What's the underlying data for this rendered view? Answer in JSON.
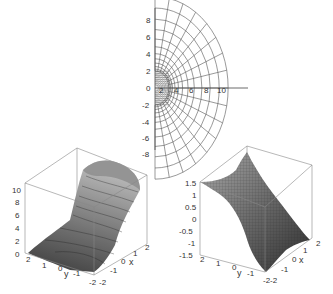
{
  "chart_data": [
    {
      "type": "line",
      "title": "",
      "description": "2D conformal-map grid: concentric semicircular arcs with radial lines in the right half-plane",
      "xlabel": "",
      "ylabel": "",
      "xticks": [
        "2",
        "4",
        "6",
        "8",
        "10"
      ],
      "yticks": [
        "8",
        "6",
        "4",
        "2",
        "0",
        "-2",
        "-4",
        "-6",
        "-8"
      ],
      "xlim": [
        0,
        11
      ],
      "ylim": [
        -9,
        9
      ],
      "grid": false,
      "arcs_radii": [
        2,
        2.2,
        2.5,
        2.9,
        3.4,
        4.0,
        4.8,
        5.7,
        6.8,
        8.0,
        9.3,
        10.6
      ],
      "radial_lines": 17,
      "line_color": "#555555"
    },
    {
      "type": "surface",
      "title": "",
      "xlabel": "x",
      "ylabel": "y",
      "zlabel": "",
      "xticks": [
        "-2",
        "-1",
        "0",
        "1",
        "2"
      ],
      "yticks": [
        "2",
        "1",
        "0",
        "-1",
        "-2"
      ],
      "zticks": [
        "0",
        "2",
        "4",
        "6",
        "8",
        "10"
      ],
      "xlim": [
        -2,
        2
      ],
      "ylim": [
        -2,
        2
      ],
      "zlim": [
        0,
        11
      ],
      "style": "grayscale shaded with contour lines",
      "description": "bowl/trough surface rising toward the back; minimum near z=2 at front, up to ~11 at back"
    },
    {
      "type": "surface",
      "title": "",
      "xlabel": "x",
      "ylabel": "y",
      "zlabel": "",
      "xticks": [
        "-2",
        "-1",
        "0",
        "1",
        "2"
      ],
      "yticks": [
        "2",
        "1",
        "0",
        "-1",
        "-2"
      ],
      "zticks": [
        "1.5",
        "1",
        "0.5",
        "0",
        "-0.5",
        "-1",
        "-1.5"
      ],
      "xlim": [
        -2,
        2
      ],
      "ylim": [
        -2,
        2
      ],
      "zlim": [
        -1.6,
        1.6
      ],
      "style": "grayscale shaded wireframe mesh",
      "description": "saddle-like ridge surface descending from ~1.5 at back-left to ~-1.5 at front-right"
    }
  ],
  "plots": {
    "top": {
      "xticks": [
        "2",
        "4",
        "6",
        "8",
        "10"
      ],
      "yticks": [
        "8",
        "6",
        "4",
        "2",
        "0",
        "-2",
        "-4",
        "-6",
        "-8"
      ]
    },
    "left3d": {
      "zticks": [
        "10",
        "8",
        "6",
        "4",
        "2",
        "0"
      ],
      "yticks": [
        "2",
        "1",
        "0",
        "-1",
        "-2"
      ],
      "xticks": [
        "-2",
        "-1",
        "0",
        "1",
        "2"
      ],
      "ylabel": "y",
      "xlabel": "x"
    },
    "right3d": {
      "zticks": [
        "1.5",
        "1",
        "0.5",
        "0",
        "-0.5",
        "-1",
        "-1.5"
      ],
      "yticks": [
        "2",
        "1",
        "0",
        "-1",
        "-2"
      ],
      "xticks": [
        "-2",
        "-1",
        "0",
        "1",
        "2"
      ],
      "ylabel": "y",
      "xlabel": "x"
    }
  }
}
